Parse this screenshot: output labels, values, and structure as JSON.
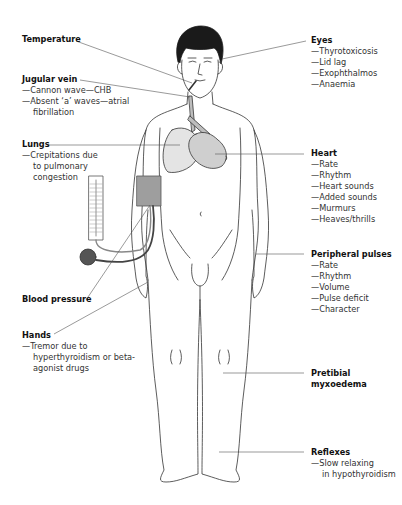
{
  "diagram": {
    "type": "anatomical-annotation",
    "colors": {
      "line": "#333333",
      "hair": "#1a1a1a",
      "fill_grey": "#bdbdbd",
      "lung_fill": "#d9d9d9",
      "heart_fill": "#cfcfcf"
    }
  },
  "labels": {
    "temperature": {
      "title": "Temperature",
      "items": []
    },
    "jugular_vein": {
      "title": "Jugular vein",
      "items": [
        "—Cannon wave—CHB",
        "—Absent ‘a’ waves—atrial",
        "fibrillation"
      ]
    },
    "lungs": {
      "title": "Lungs",
      "items": [
        "—Crepitations due",
        "to pulmonary",
        "congestion"
      ]
    },
    "blood_pressure": {
      "title": "Blood pressure",
      "items": []
    },
    "hands": {
      "title": "Hands",
      "items": [
        "—Tremor due to",
        "hyperthyroidism or beta-",
        "agonist drugs"
      ]
    },
    "eyes": {
      "title": "Eyes",
      "items": [
        "—Thyrotoxicosis",
        "—Lid lag",
        "—Exophthalmos",
        "—Anaemia"
      ]
    },
    "heart": {
      "title": "Heart",
      "items": [
        "—Rate",
        "—Rhythm",
        "—Heart sounds",
        "—Added sounds",
        "—Murmurs",
        "—Heaves/thrills"
      ]
    },
    "peripheral_pulses": {
      "title": "Peripheral pulses",
      "items": [
        "—Rate",
        "—Rhythm",
        "—Volume",
        "—Pulse deficit",
        "—Character"
      ]
    },
    "pretibial": {
      "title": "Pretibial",
      "title2": "myxoedema",
      "items": []
    },
    "reflexes": {
      "title": "Reflexes",
      "items": [
        "—Slow relaxing",
        "in hypothyroidism"
      ]
    }
  }
}
